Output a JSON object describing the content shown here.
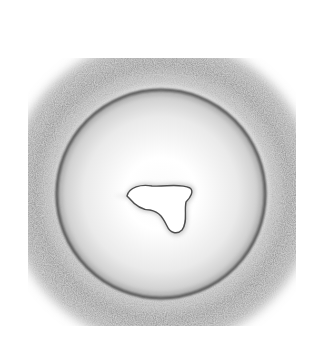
{
  "image": {
    "description": "Grayscale pencil-style drawing of a round cell-like body with a dark ring and soft outer halo, containing an irregular white lobed blob at its center",
    "background": "#ffffff",
    "colors": {
      "halo": "#8a8a8a",
      "ring": "#3c3c3c",
      "interior": "#f2f2f2",
      "blob": "#ffffff",
      "blob_edge": "#555555"
    }
  }
}
